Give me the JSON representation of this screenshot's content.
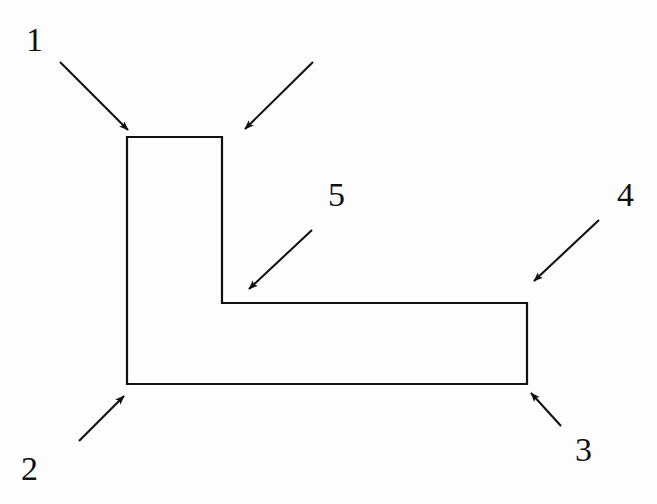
{
  "figure": {
    "kind": "line-drawing",
    "background_color": "#fdfdfd",
    "stroke_color": "#111111",
    "fill_color": "none",
    "stroke_width": 2,
    "canvas": {
      "width": 657,
      "height": 504
    },
    "shape": {
      "name": "l-shape-outline",
      "points": "127,137 222,137 222,303 527,303 527,384 127,384",
      "closed": true,
      "vertices": [
        {
          "id": "v1",
          "x": 127,
          "y": 137,
          "role": "top-left"
        },
        {
          "id": "v2",
          "x": 222,
          "y": 137,
          "role": "top-right-of-vertical-arm"
        },
        {
          "id": "v3",
          "x": 222,
          "y": 303,
          "role": "inner-reflex-corner"
        },
        {
          "id": "v4",
          "x": 527,
          "y": 303,
          "role": "top-right-of-horizontal-arm"
        },
        {
          "id": "v5",
          "x": 527,
          "y": 384,
          "role": "bottom-right"
        },
        {
          "id": "v6",
          "x": 127,
          "y": 384,
          "role": "bottom-left"
        }
      ]
    },
    "arrows": [
      {
        "id": "arrow-1",
        "label": "1",
        "tail": {
          "x": 60,
          "y": 62
        },
        "head": {
          "x": 128,
          "y": 130
        },
        "points_to": "top-left-corner"
      },
      {
        "id": "arrow-1b",
        "label": "",
        "tail": {
          "x": 313,
          "y": 62
        },
        "head": {
          "x": 245,
          "y": 129
        },
        "points_to": "top-edge-right-end"
      },
      {
        "id": "arrow-2",
        "label": "2",
        "tail": {
          "x": 79,
          "y": 441
        },
        "head": {
          "x": 124,
          "y": 396
        },
        "points_to": "bottom-left-corner"
      },
      {
        "id": "arrow-3",
        "label": "3",
        "tail": {
          "x": 561,
          "y": 426
        },
        "head": {
          "x": 531,
          "y": 393
        },
        "points_to": "bottom-right-corner"
      },
      {
        "id": "arrow-4",
        "label": "4",
        "tail": {
          "x": 599,
          "y": 220
        },
        "head": {
          "x": 534,
          "y": 281
        },
        "points_to": "right-edge-upper"
      },
      {
        "id": "arrow-5",
        "label": "5",
        "tail": {
          "x": 312,
          "y": 230
        },
        "head": {
          "x": 249,
          "y": 289
        },
        "points_to": "inner-reflex-corner"
      }
    ]
  },
  "labels": {
    "one": "1",
    "two": "2",
    "three": "3",
    "four": "4",
    "five": "5"
  }
}
